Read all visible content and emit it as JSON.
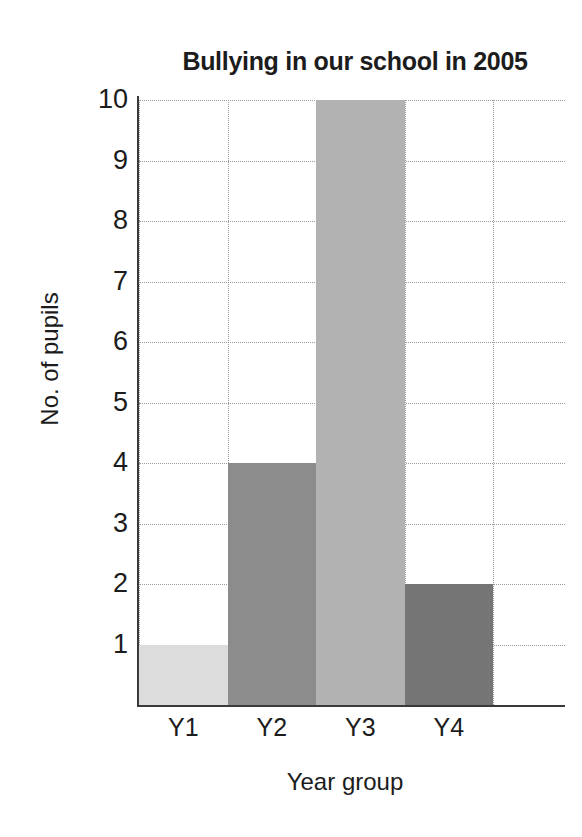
{
  "chart_data": {
    "type": "bar",
    "title": "Bullying in our school in 2005",
    "xlabel": "Year group",
    "ylabel": "No. of pupils",
    "categories": [
      "Y1",
      "Y2",
      "Y3",
      "Y4"
    ],
    "values": [
      1,
      4,
      10,
      2
    ],
    "ylim": [
      0,
      10
    ],
    "yticks": [
      1,
      2,
      3,
      4,
      5,
      6,
      7,
      8,
      9,
      10
    ],
    "ytick_labels": [
      "1",
      "2",
      "3",
      "4",
      "5",
      "6",
      "7",
      "8",
      "9",
      "10"
    ],
    "grid": true,
    "grid_style": "dotted",
    "legend": false,
    "bar_colors": [
      "#dcdcdc",
      "#8c8c8c",
      "#b2b2b2",
      "#757575"
    ],
    "axis_color": "#3a3a3a",
    "grid_color": "#9a9a9a",
    "background": "#ffffff",
    "text_color": "#1c1c1c"
  }
}
